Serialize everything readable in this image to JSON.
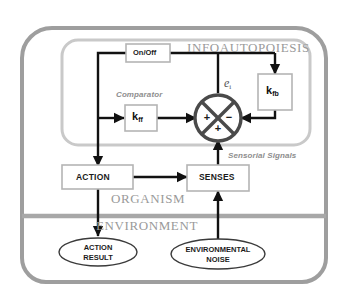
{
  "diagram": {
    "regions": {
      "infoautopoiesis": "INFOAUTOPOIESIS",
      "organism": "ORGANISM",
      "environment": "ENVIRONMENT"
    },
    "annotations": {
      "comparator": "Comparator",
      "sensorial_signals": "Sensorial Signals",
      "error_signal": "e",
      "error_signal_subscript": "i"
    },
    "nodes": {
      "on_off": "On/Off",
      "k_ff": "k",
      "k_ff_sub": "ff",
      "k_fb": "k",
      "k_fb_sub": "fb",
      "action": "ACTION",
      "senses": "SENSES"
    },
    "comparator_signs": {
      "left": "+",
      "right": "−",
      "bottom": "+"
    },
    "environment_nodes": {
      "action_result_line1": "ACTION",
      "action_result_line2": "RESULT",
      "environmental_noise_line1": "ENVIRONMENTAL",
      "environmental_noise_line2": "NOISE"
    },
    "colors": {
      "organism_boundary": "#9e9e9e",
      "infoautopoiesis_boundary": "#c9c9c9",
      "divider": "#a8a8a8",
      "signal_line": "#111111",
      "box_border": "#b5b5b5",
      "region_text": "#9a9a9a",
      "annotation_text": "#8e8e8e",
      "comparator_stroke": "#4a4a4a",
      "background": "#ffffff"
    }
  }
}
